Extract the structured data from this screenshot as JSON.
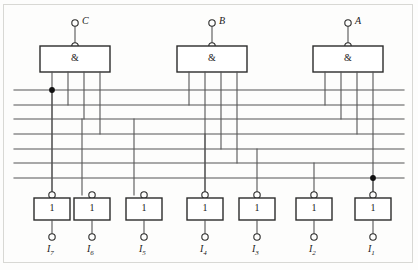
{
  "diagram": {
    "type": "logic-circuit",
    "canvas": {
      "width": 418,
      "height": 270
    },
    "style": {
      "wire_color": "#555555",
      "box_stroke": "#2b2b2b",
      "terminal_stroke": "#2b2b2b",
      "frame_color": "#d8d8d4",
      "background": "#fdfdfc",
      "junction_fill": "#111111"
    },
    "inputs": [
      {
        "id": "C",
        "label": "C",
        "terminal_x": 75,
        "terminal_y": 23,
        "stub_bottom_y": 46
      },
      {
        "id": "B",
        "label": "B",
        "terminal_x": 212,
        "terminal_y": 23,
        "stub_bottom_y": 46
      },
      {
        "id": "A",
        "label": "A",
        "terminal_x": 348,
        "terminal_y": 23,
        "stub_bottom_y": 46
      }
    ],
    "and_gates": [
      {
        "id": "and-c",
        "symbol": "&",
        "x": 40,
        "y": 46,
        "w": 70,
        "h": 26,
        "input": "C",
        "pin_xs": [
          52,
          68,
          84,
          100
        ]
      },
      {
        "id": "and-b",
        "symbol": "&",
        "x": 177,
        "y": 46,
        "w": 70,
        "h": 26,
        "input": "B",
        "pin_xs": [
          189,
          205,
          221,
          237
        ]
      },
      {
        "id": "and-a",
        "symbol": "&",
        "x": 313,
        "y": 46,
        "w": 70,
        "h": 26,
        "input": "A",
        "pin_xs": [
          325,
          341,
          357,
          373
        ]
      }
    ],
    "bus_lines": [
      {
        "index": 1,
        "y": 90,
        "x1": 14,
        "x2": 404
      },
      {
        "index": 2,
        "y": 105,
        "x1": 14,
        "x2": 404
      },
      {
        "index": 3,
        "y": 119,
        "x1": 14,
        "x2": 404
      },
      {
        "index": 4,
        "y": 134,
        "x1": 14,
        "x2": 404
      },
      {
        "index": 5,
        "y": 149,
        "x1": 14,
        "x2": 404
      },
      {
        "index": 6,
        "y": 163,
        "x1": 14,
        "x2": 404
      },
      {
        "index": 7,
        "y": 178,
        "x1": 14,
        "x2": 404
      }
    ],
    "gate_drops": [
      {
        "from": "and-c",
        "pin_x": 52,
        "to_y": 195,
        "note": "runs full height to output gate I7"
      },
      {
        "from": "and-c",
        "pin_x": 68,
        "to_y": 105,
        "note": "ends on bus line 2"
      },
      {
        "from": "and-c",
        "pin_x": 84,
        "to_y": 119,
        "note": "ends on bus line 3"
      },
      {
        "from": "and-c",
        "pin_x": 100,
        "to_y": 134,
        "note": "ends on bus line 4"
      },
      {
        "from": "and-b",
        "pin_x": 189,
        "to_y": 105,
        "note": "ends on bus line 2"
      },
      {
        "from": "and-b",
        "pin_x": 205,
        "to_y": 195,
        "note": "runs down to output gate I4"
      },
      {
        "from": "and-b",
        "pin_x": 221,
        "to_y": 149,
        "note": "ends on bus line 5"
      },
      {
        "from": "and-b",
        "pin_x": 237,
        "to_y": 163,
        "note": "ends on bus line 6"
      },
      {
        "from": "and-a",
        "pin_x": 325,
        "to_y": 105,
        "note": "ends on bus line 2"
      },
      {
        "from": "and-a",
        "pin_x": 341,
        "to_y": 119,
        "note": "ends on bus line 3"
      },
      {
        "from": "and-a",
        "pin_x": 357,
        "to_y": 134,
        "note": "ends on bus line 4"
      },
      {
        "from": "and-a",
        "pin_x": 373,
        "to_y": 195,
        "note": "runs down to output gate I1"
      }
    ],
    "bus_taps": [
      {
        "to_output": "I7",
        "x": 52,
        "from_y": 90,
        "to_y": 195
      },
      {
        "to_output": "I6",
        "x": 82,
        "from_y": 119,
        "to_y": 195
      },
      {
        "to_output": "I5",
        "x": 134,
        "from_y": 119,
        "to_y": 195
      },
      {
        "to_output": "I4",
        "x": 205,
        "from_y": 134,
        "to_y": 195
      },
      {
        "to_output": "I3",
        "x": 257,
        "from_y": 149,
        "to_y": 195
      },
      {
        "to_output": "I2",
        "x": 314,
        "from_y": 163,
        "to_y": 195
      },
      {
        "to_output": "I1",
        "x": 373,
        "from_y": 178,
        "to_y": 195
      }
    ],
    "junctions": [
      {
        "x": 52,
        "y": 90,
        "note": "C gate pin 1 crosses bus line 1"
      },
      {
        "x": 373,
        "y": 178,
        "note": "A gate pin 4 crosses bus line 7"
      }
    ],
    "output_gates": [
      {
        "id": "I7",
        "symbol": "1",
        "label": "I",
        "sub": "7",
        "cx": 52,
        "box_y": 198,
        "box_w": 36,
        "box_h": 22,
        "in_term_y": 195,
        "out_term_y": 237,
        "label_y": 243
      },
      {
        "id": "I6",
        "symbol": "1",
        "label": "I",
        "sub": "6",
        "cx": 92,
        "box_y": 198,
        "box_w": 36,
        "box_h": 22,
        "in_term_y": 195,
        "out_term_y": 237,
        "label_y": 243
      },
      {
        "id": "I5",
        "symbol": "1",
        "label": "I",
        "sub": "5",
        "cx": 144,
        "box_y": 198,
        "box_w": 36,
        "box_h": 22,
        "in_term_y": 195,
        "out_term_y": 237,
        "label_y": 243
      },
      {
        "id": "I4",
        "symbol": "1",
        "label": "I",
        "sub": "4",
        "cx": 205,
        "box_y": 198,
        "box_w": 36,
        "box_h": 22,
        "in_term_y": 195,
        "out_term_y": 237,
        "label_y": 243
      },
      {
        "id": "I3",
        "symbol": "1",
        "label": "I",
        "sub": "3",
        "cx": 257,
        "box_y": 198,
        "box_w": 36,
        "box_h": 22,
        "in_term_y": 195,
        "out_term_y": 237,
        "label_y": 243
      },
      {
        "id": "I2",
        "symbol": "1",
        "label": "I",
        "sub": "2",
        "cx": 314,
        "box_y": 198,
        "box_w": 36,
        "box_h": 22,
        "in_term_y": 195,
        "out_term_y": 237,
        "label_y": 243
      },
      {
        "id": "I1",
        "symbol": "1",
        "label": "I",
        "sub": "1",
        "cx": 373,
        "box_y": 198,
        "box_w": 36,
        "box_h": 22,
        "in_term_y": 195,
        "out_term_y": 237,
        "label_y": 243
      }
    ]
  }
}
